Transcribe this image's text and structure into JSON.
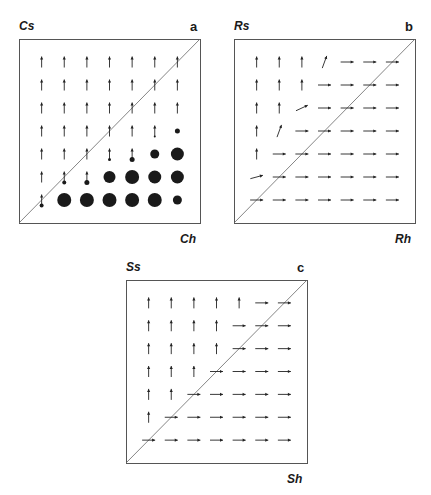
{
  "figure": {
    "panels": [
      {
        "id": "a",
        "letter": "a",
        "ylabel": "Cs",
        "xlabel": "Ch",
        "box": {
          "x": 19,
          "y": 39,
          "w": 181,
          "h": 184
        },
        "grid": [
          [
            "U",
            "U",
            "U",
            "U",
            "U",
            "U",
            "U"
          ],
          [
            "U",
            "U",
            "U",
            "U",
            "U",
            "U",
            "U"
          ],
          [
            "U",
            "U",
            "U",
            "U",
            "U",
            "U",
            "U"
          ],
          [
            "U",
            "U",
            "U",
            "U",
            "U",
            "Ud1",
            "D2.5"
          ],
          [
            "U",
            "U",
            "U",
            "Ud1.5",
            "Ud2.5",
            "D4.5",
            "D6.5"
          ],
          [
            "Us",
            "Ud2",
            "Ud2.5",
            "D6",
            "D7",
            "D6.5",
            "D6.5"
          ],
          [
            "Ud2",
            "D7",
            "D7",
            "D7",
            "D7",
            "D7",
            "D4.5"
          ]
        ]
      },
      {
        "id": "b",
        "letter": "b",
        "ylabel": "Rs",
        "xlabel": "Rh",
        "box": {
          "x": 234,
          "y": 39,
          "w": 181,
          "h": 184
        },
        "grid": [
          [
            "U",
            "U",
            "U",
            "O70",
            "R",
            "R",
            "R"
          ],
          [
            "U",
            "U",
            "U",
            "R",
            "R",
            "R",
            "R"
          ],
          [
            "U",
            "U",
            "O25",
            "R",
            "R",
            "R",
            "R"
          ],
          [
            "U",
            "O70",
            "R",
            "R",
            "R",
            "R",
            "R"
          ],
          [
            "U",
            "R",
            "R",
            "R",
            "R",
            "R",
            "R"
          ],
          [
            "O15",
            "R",
            "R",
            "R",
            "R",
            "R",
            "R"
          ],
          [
            "R",
            "R",
            "R",
            "R",
            "R",
            "R",
            "R"
          ]
        ]
      },
      {
        "id": "c",
        "letter": "c",
        "ylabel": "Ss",
        "xlabel": "Sh",
        "box": {
          "x": 126,
          "y": 280,
          "w": 181,
          "h": 183
        },
        "grid": [
          [
            "U",
            "U",
            "U",
            "U",
            "U",
            "R",
            "R"
          ],
          [
            "U",
            "U",
            "U",
            "U",
            "R",
            "R",
            "R"
          ],
          [
            "U",
            "U",
            "U",
            "U",
            "R",
            "R",
            "R"
          ],
          [
            "U",
            "U",
            "U",
            "R",
            "R",
            "R",
            "R"
          ],
          [
            "U",
            "U",
            "R",
            "R",
            "R",
            "R",
            "R"
          ],
          [
            "U",
            "R",
            "R",
            "R",
            "R",
            "R",
            "R"
          ],
          [
            "R",
            "R",
            "R",
            "R",
            "R",
            "R",
            "R"
          ]
        ]
      }
    ],
    "legend_codes": {
      "U": "arrow-up",
      "Us": "short-arrow-up",
      "R": "arrow-right",
      "O": "oblique-arrow (angle deg from horizontal)",
      "D": "filled-dot (radius px)",
      "Ud": "arrow-up with dot (radius px)"
    }
  },
  "colors": {
    "ink": "#1a1a1a",
    "frame": "#555555",
    "diagonal": "#666666",
    "arrow": "#222222",
    "dot": "#1a1a1a"
  }
}
